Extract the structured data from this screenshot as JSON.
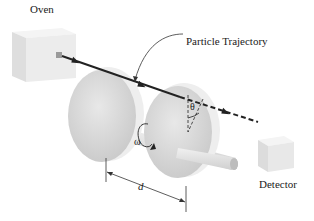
{
  "diagram": {
    "labels": {
      "oven": "Oven",
      "particle_trajectory": "Particle Trajectory",
      "detector": "Detector",
      "omega": "ω",
      "theta": "θ",
      "d": "d"
    },
    "components": [
      {
        "id": "oven",
        "type": "box",
        "label": "Oven"
      },
      {
        "id": "disk-1",
        "type": "disk"
      },
      {
        "id": "disk-2",
        "type": "disk"
      },
      {
        "id": "axle",
        "type": "shaft"
      },
      {
        "id": "detector",
        "type": "box",
        "label": "Detector"
      }
    ],
    "annotations": {
      "trajectory_solid": "from oven through disk 1",
      "trajectory_dashed": "from disk 2 to detector",
      "rotation": "ω (angular velocity about axle)",
      "angle": "θ (angular offset between slits)",
      "separation": "d (distance between disks)"
    },
    "colors": {
      "box_light": "#f2f2f2",
      "box_mid": "#dcdcdc",
      "box_dark": "#c8c8c8",
      "disk_face": "#d9d9d9",
      "disk_edge": "#eeeeee",
      "line": "#222222"
    }
  }
}
